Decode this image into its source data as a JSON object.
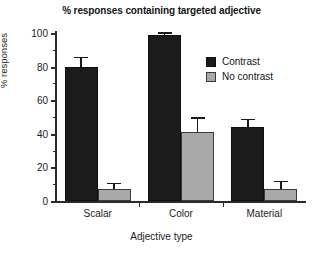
{
  "chart_data": {
    "type": "bar",
    "title": "% responses containing targeted adjective",
    "xlabel": "Adjective type",
    "ylabel": "% responses",
    "categories": [
      "Scalar",
      "Color",
      "Material"
    ],
    "ylim": [
      0,
      100
    ],
    "yticks": [
      0,
      20,
      40,
      60,
      80,
      100
    ],
    "ytick_labels": [
      "0",
      "20",
      "40",
      "60",
      "80",
      "100"
    ],
    "yminor_ticks": [
      10,
      30,
      50,
      70,
      90
    ],
    "grid": false,
    "legend_position": "upper right",
    "series": [
      {
        "name": "Contrast",
        "color": "#1b1b1b",
        "values": [
          80,
          99,
          44
        ],
        "errors": [
          6,
          1.5,
          5
        ]
      },
      {
        "name": "No contrast",
        "color": "#a9a9a9",
        "values": [
          7,
          41,
          7
        ],
        "errors": [
          4,
          9,
          5
        ]
      }
    ]
  },
  "legend": {
    "items": [
      {
        "label": "Contrast"
      },
      {
        "label": "No contrast"
      }
    ]
  }
}
